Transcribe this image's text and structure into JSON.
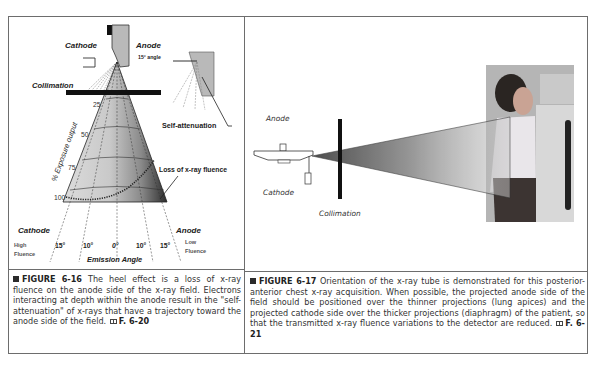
{
  "figure_6_16": {
    "labels": {
      "cathode_top": "Cathode",
      "anode_top": "Anode",
      "anode_angle": "15° angle",
      "collimation": "Collimation",
      "self_attenuation": "Self-attenuation",
      "y_axis": "% Exposure output",
      "loss": "Loss of x-ray fluence",
      "cathode_bottom": "Cathode",
      "anode_bottom": "Anode",
      "high_fluence_1": "High",
      "high_fluence_2": "Fluence",
      "low_fluence_1": "Low",
      "low_fluence_2": "Fluence",
      "emission_angle": "Emission Angle"
    },
    "exposure_ticks": [
      "25",
      "50",
      "75",
      "100"
    ],
    "angle_ticks": [
      "15°",
      "10°",
      "0°",
      "10°",
      "15°"
    ],
    "caption": {
      "label": "FIGURE 6-16",
      "text": " The heel effect is a loss of x-ray fluence on the anode side of the x-ray field. Electrons interacting at depth within the anode result in the \"self-attenuation\" of x-rays that have a trajectory toward the anode side of the field. ",
      "ref": "F. 6-20"
    }
  },
  "figure_6_17": {
    "labels": {
      "anode": "Anode",
      "cathode": "Cathode",
      "collimation": "Collimation"
    },
    "caption": {
      "label": "FIGURE 6-17",
      "text": " Orientation of the x-ray tube is demonstrated for this posterior-anterior chest x-ray acquisition. When possible, the projected anode side of the field should be positioned over the thinner projections (lung apices) and the projected cathode side over the thicker projections (diaphragm) of the patient, so that the transmitted x-ray fluence variations to the detector are reduced. ",
      "ref": "F. 6-21"
    }
  },
  "colors": {
    "border": "#6d6d6d",
    "caption_text": "#333333",
    "cone_light": "#d6d6d6",
    "cone_dark": "#3a3a3a"
  }
}
